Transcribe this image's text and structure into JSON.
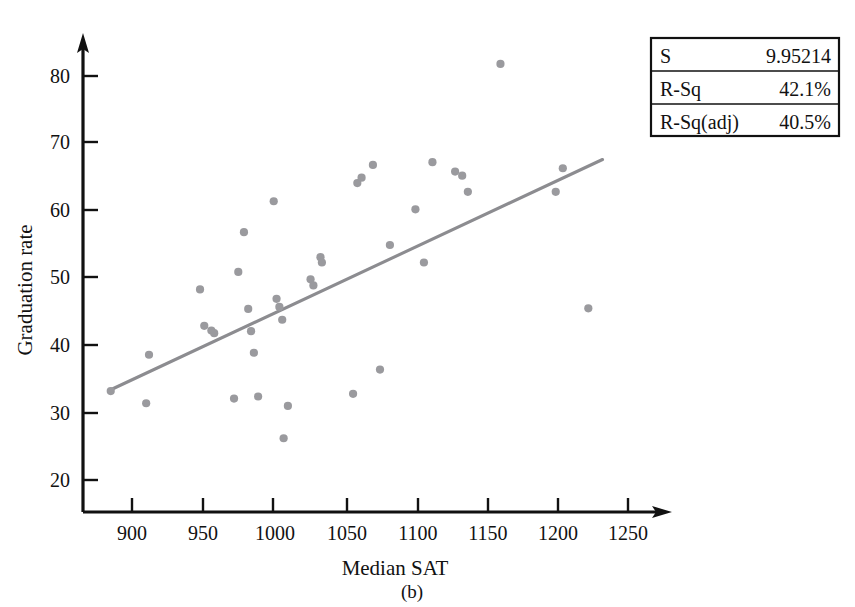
{
  "figure": {
    "caption": "(b)"
  },
  "chart_data": {
    "type": "scatter",
    "title": "",
    "xlabel": "Median SAT",
    "ylabel": "Graduation rate",
    "xlim": [
      880,
      1265
    ],
    "ylim": [
      17,
      84
    ],
    "xticks": [
      900,
      950,
      1000,
      1050,
      1100,
      1150,
      1200,
      1250
    ],
    "yticks": [
      20,
      30,
      40,
      50,
      60,
      70,
      80
    ],
    "grid": false,
    "legend": "none",
    "point_color": "#9a9a9e",
    "line_color": "#8c8c90",
    "axis_color": "#111111",
    "points": [
      {
        "x": 885,
        "y": 33.2
      },
      {
        "x": 910,
        "y": 31.4
      },
      {
        "x": 912,
        "y": 38.6
      },
      {
        "x": 948,
        "y": 48.3
      },
      {
        "x": 951,
        "y": 42.9
      },
      {
        "x": 956,
        "y": 42.2
      },
      {
        "x": 958,
        "y": 41.8
      },
      {
        "x": 972,
        "y": 32.1
      },
      {
        "x": 975,
        "y": 50.9
      },
      {
        "x": 979,
        "y": 56.8
      },
      {
        "x": 982,
        "y": 45.4
      },
      {
        "x": 984,
        "y": 42.1
      },
      {
        "x": 986,
        "y": 38.9
      },
      {
        "x": 989,
        "y": 32.4
      },
      {
        "x": 1000,
        "y": 61.4
      },
      {
        "x": 1002,
        "y": 46.9
      },
      {
        "x": 1004,
        "y": 45.7
      },
      {
        "x": 1006,
        "y": 43.8
      },
      {
        "x": 1007,
        "y": 26.2
      },
      {
        "x": 1010,
        "y": 31.0
      },
      {
        "x": 1026,
        "y": 49.8
      },
      {
        "x": 1028,
        "y": 48.9
      },
      {
        "x": 1033,
        "y": 53.1
      },
      {
        "x": 1034,
        "y": 52.3
      },
      {
        "x": 1056,
        "y": 32.8
      },
      {
        "x": 1059,
        "y": 64.1
      },
      {
        "x": 1062,
        "y": 64.9
      },
      {
        "x": 1070,
        "y": 66.8
      },
      {
        "x": 1075,
        "y": 36.4
      },
      {
        "x": 1082,
        "y": 54.9
      },
      {
        "x": 1100,
        "y": 60.2
      },
      {
        "x": 1106,
        "y": 52.3
      },
      {
        "x": 1112,
        "y": 67.2
      },
      {
        "x": 1128,
        "y": 65.8
      },
      {
        "x": 1133,
        "y": 65.2
      },
      {
        "x": 1137,
        "y": 62.8
      },
      {
        "x": 1160,
        "y": 81.8
      },
      {
        "x": 1199,
        "y": 62.8
      },
      {
        "x": 1204,
        "y": 66.3
      },
      {
        "x": 1222,
        "y": 45.5
      }
    ],
    "fit_line": {
      "x0": 885,
      "y0": 33.4,
      "x1": 1232,
      "y1": 67.6
    }
  },
  "stats_box": {
    "rows": [
      {
        "label": "S",
        "value": "9.95214"
      },
      {
        "label": "R-Sq",
        "value": "42.1%"
      },
      {
        "label": "R-Sq(adj)",
        "value": "40.5%"
      }
    ]
  }
}
